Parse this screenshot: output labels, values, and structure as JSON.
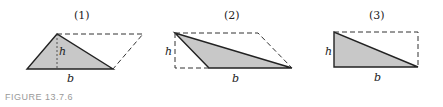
{
  "caption": "FIGURE 13.7.6",
  "panels": [
    {
      "label": "(1)",
      "height_label": "h",
      "base_label": "b"
    },
    {
      "label": "(2)",
      "height_label": "h",
      "base_label": "b"
    },
    {
      "label": "(3)",
      "height_label": "h",
      "base_label": "b"
    }
  ],
  "colors": {
    "fill": "#c8c8c8",
    "stroke": "#222222"
  }
}
